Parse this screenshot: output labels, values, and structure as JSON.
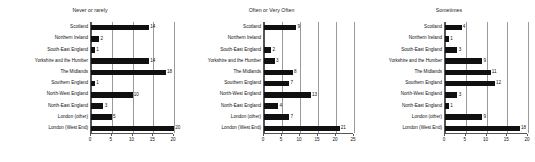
{
  "chart_data": [
    {
      "type": "bar",
      "title": "Never or rarely",
      "orientation": "horizontal",
      "xlabel": "",
      "ylabel": "",
      "xlim": [
        0,
        20
      ],
      "xticks": [
        0,
        5,
        10,
        15,
        20
      ],
      "grid": true,
      "legend": false,
      "categories": [
        "Scotland",
        "Northern Ireland",
        "South-East England",
        "Yorkshire and the Humber",
        "The Midlands",
        "Southern England",
        "North-West England",
        "North-East England",
        "London (other)",
        "London (West End)"
      ],
      "values": [
        14,
        2,
        1,
        14,
        18,
        1,
        10,
        3,
        5,
        20
      ],
      "data_labels": [
        "14",
        "2",
        "1",
        "14",
        "18",
        "1",
        "10",
        "3",
        "5",
        "20"
      ]
    },
    {
      "type": "bar",
      "title": "Often or Very Often",
      "orientation": "horizontal",
      "xlabel": "",
      "ylabel": "",
      "xlim": [
        0,
        25
      ],
      "xticks": [
        0,
        5,
        10,
        15,
        20,
        25
      ],
      "grid": true,
      "legend": false,
      "categories": [
        "Scotland",
        "Northern Ireland",
        "South-East England",
        "Yorkshire and the Humber",
        "The Midlands",
        "Southern England",
        "North-West England",
        "North-East England",
        "London (other)",
        "London (West End)"
      ],
      "values": [
        9,
        0,
        2,
        3,
        8,
        7,
        13,
        4,
        7,
        21
      ],
      "data_labels": [
        "9",
        "",
        "2",
        "3",
        "8",
        "7",
        "13",
        "4",
        "7",
        "21"
      ]
    },
    {
      "type": "bar",
      "title": "Sometimes",
      "orientation": "horizontal",
      "xlabel": "",
      "ylabel": "",
      "xlim": [
        0,
        20
      ],
      "xticks": [
        0,
        5,
        10,
        15,
        20
      ],
      "grid": true,
      "legend": false,
      "categories": [
        "Scotland",
        "Northern Ireland",
        "South-East England",
        "Yorkshire and the Humber",
        "The Midlands",
        "Southern England",
        "North-West England",
        "North-East England",
        "London (other)",
        "London (West End)"
      ],
      "values": [
        4,
        1,
        3,
        9,
        11,
        12,
        3,
        1,
        9,
        18
      ],
      "data_labels": [
        "4",
        "1",
        "3",
        "9",
        "11",
        "12",
        "3",
        "1",
        "9",
        "18"
      ]
    }
  ],
  "style": {
    "bar_color": "#101010",
    "grid_color": "#9a9a9a",
    "axis_color": "#555555",
    "text_color": "#111111",
    "background": "#ffffff"
  }
}
